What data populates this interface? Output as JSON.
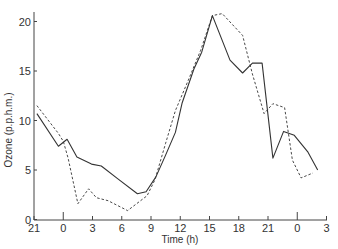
{
  "chart_data": {
    "type": "line",
    "title": "",
    "xlabel": "Time (h)",
    "ylabel": "Ozone (p.p.h.m.)",
    "ylim": [
      0,
      21
    ],
    "xlim_hours": [
      21,
      51
    ],
    "x_tick_positions_hours": [
      21,
      24,
      27,
      30,
      33,
      36,
      39,
      42,
      45,
      48,
      51
    ],
    "x_tick_labels": [
      "21",
      "0",
      "3",
      "6",
      "9",
      "12",
      "15",
      "18",
      "21",
      "0",
      "3"
    ],
    "y_ticks": [
      0,
      5,
      10,
      15,
      20
    ],
    "y_tick_labels": [
      "0",
      "5",
      "10",
      "15",
      "20"
    ],
    "grid": false,
    "legend": null,
    "series": [
      {
        "name": "solid",
        "style": "solid",
        "x_hours": [
          21.3,
          23.5,
          24.4,
          25.4,
          26.9,
          27.9,
          29.6,
          31.6,
          32.5,
          33.5,
          34.5,
          35.5,
          36.2,
          37.4,
          38.2,
          39.3,
          41.1,
          42.4,
          43.4,
          44.4,
          45.5,
          46.6,
          47.7,
          49.1,
          50.1
        ],
        "values": [
          10.7,
          7.4,
          8.1,
          6.3,
          5.6,
          5.4,
          4.1,
          2.6,
          2.8,
          4.3,
          6.5,
          8.8,
          11.8,
          15.2,
          16.9,
          20.6,
          16.1,
          14.8,
          15.8,
          15.8,
          6.2,
          8.9,
          8.5,
          6.8,
          5.0
        ]
      },
      {
        "name": "dashed",
        "style": "dashed",
        "x_hours": [
          21.3,
          23.5,
          24.0,
          24.5,
          25.5,
          26.6,
          27.4,
          28.6,
          30.6,
          32.6,
          33.4,
          34.5,
          35.5,
          36.8,
          38.1,
          39.3,
          40.3,
          42.4,
          43.4,
          44.6,
          45.5,
          46.7,
          47.5,
          48.4,
          49.6
        ],
        "values": [
          11.5,
          8.7,
          7.9,
          6.2,
          1.6,
          3.1,
          2.2,
          1.9,
          0.9,
          2.4,
          4.0,
          7.7,
          11.0,
          14.0,
          17.1,
          20.6,
          20.8,
          18.6,
          14.7,
          10.7,
          11.7,
          11.3,
          6.0,
          4.2,
          4.7
        ]
      }
    ]
  },
  "colors": {
    "line": "#333333",
    "axis": "#444444",
    "background": "#ffffff"
  }
}
